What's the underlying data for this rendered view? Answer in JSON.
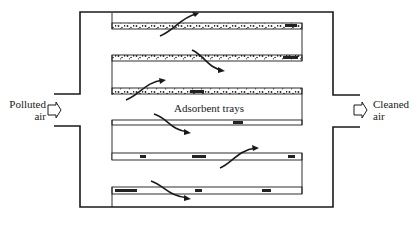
{
  "diagram": {
    "type": "adsorption unit schematic",
    "labels": {
      "inlet_line1": "Polluted",
      "inlet_line2": "air",
      "outlet_line1": "Cleaned",
      "outlet_line2": "air",
      "trays": "Adsorbent trays"
    },
    "components": [
      {
        "name": "housing",
        "description": "rectangular adsorber casing with inlet and outlet ducts"
      },
      {
        "name": "inlet-duct",
        "label": "Polluted air",
        "side": "left"
      },
      {
        "name": "outlet-duct",
        "label": "Cleaned air",
        "side": "right"
      },
      {
        "name": "adsorbent-trays",
        "label": "Adsorbent trays",
        "count": 6
      }
    ],
    "colors": {
      "line": "#1a1a1a",
      "background": "#ffffff"
    }
  }
}
